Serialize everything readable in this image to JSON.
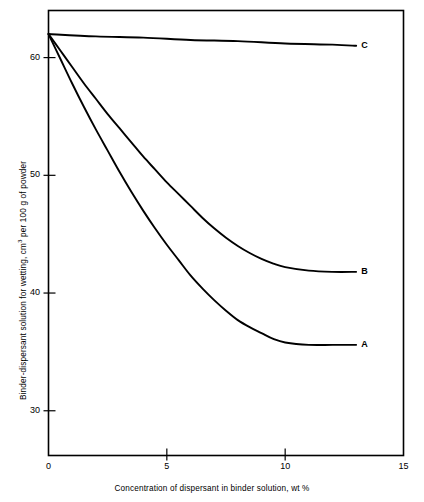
{
  "chart_data": {
    "type": "line",
    "title": "",
    "xlabel": "Concentration of dispersant in binder solution, wt %",
    "ylabel": "Binder-dispersant solution for wetting, cm3 per 100 g of powder",
    "ylabel_prefix": "Binder-dispersant solution for wetting, cm",
    "ylabel_superscript": "3",
    "ylabel_suffix": " per 100 g of powder",
    "xlim": [
      0,
      15
    ],
    "ylim": [
      26.2,
      64.0
    ],
    "xticks": [
      0,
      5,
      10,
      15
    ],
    "xtick_labels": [
      "0",
      "5",
      "10",
      "15"
    ],
    "yticks": [
      30,
      40,
      50,
      60
    ],
    "ytick_labels": [
      "30",
      "40",
      "50",
      "60"
    ],
    "grid": false,
    "legend": "inline-end-labels",
    "line_color": "#000000",
    "axis_color": "#000000",
    "background": "#ffffff",
    "series": [
      {
        "name": "A",
        "label": "A",
        "x": [
          0,
          0.5,
          1,
          1.5,
          2,
          2.5,
          3,
          3.5,
          4,
          4.5,
          5,
          5.5,
          6,
          6.5,
          7,
          7.5,
          8,
          8.5,
          9,
          9.5,
          10,
          11,
          12,
          13
        ],
        "values": [
          62.0,
          59.9,
          57.8,
          55.8,
          53.9,
          52.1,
          50.3,
          48.6,
          47.0,
          45.5,
          44.1,
          42.8,
          41.5,
          40.4,
          39.4,
          38.5,
          37.7,
          37.1,
          36.6,
          36.1,
          35.8,
          35.6,
          35.6,
          35.6
        ]
      },
      {
        "name": "B",
        "label": "B",
        "x": [
          0,
          0.5,
          1,
          1.5,
          2,
          2.5,
          3,
          3.5,
          4,
          4.5,
          5,
          5.5,
          6,
          6.5,
          7,
          7.5,
          8,
          8.5,
          9,
          9.5,
          10,
          11,
          12,
          13
        ],
        "values": [
          62.0,
          60.6,
          59.2,
          57.8,
          56.5,
          55.2,
          54.0,
          52.8,
          51.6,
          50.5,
          49.4,
          48.4,
          47.4,
          46.4,
          45.5,
          44.7,
          44.0,
          43.4,
          42.9,
          42.5,
          42.2,
          41.9,
          41.8,
          41.8
        ]
      },
      {
        "name": "C",
        "label": "C",
        "x": [
          0,
          2,
          4,
          6,
          8,
          10,
          12,
          13
        ],
        "values": [
          62.0,
          61.8,
          61.7,
          61.5,
          61.4,
          61.2,
          61.1,
          61.0
        ]
      }
    ]
  },
  "axes": {
    "frame_label": "plot-frame"
  }
}
